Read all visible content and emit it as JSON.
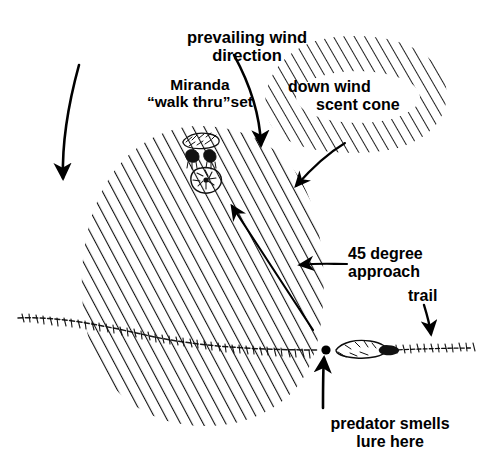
{
  "diagram": {
    "background_color": "#ffffff",
    "ink_color": "#000000",
    "labels": {
      "prevailing_wind_line1": "prevailing wind",
      "prevailing_wind_line2": "direction",
      "miranda_line1": "Miranda",
      "miranda_line2": "“walk thru”set",
      "down_wind_line1": "down wind",
      "down_wind_line2": "scent cone",
      "approach_line1": "45 degree",
      "approach_line2": "approach",
      "trail": "trail",
      "predator_line1": "predator smells",
      "predator_line2": "lure here"
    },
    "elements": {
      "scent_cone_region": "down-wind-scent-cone-ellipse",
      "main_cone_region": "main-scent-cone-ellipse",
      "trap_set_marker": "miranda-walk-thru-set-marker",
      "lure_point": "predator-smells-lure-point",
      "trail_path": "animal-trail-line",
      "approach_line": "45-degree-approach-line",
      "wind_arrow_left": "prevailing-wind-arrow-left",
      "wind_arrow_right": "prevailing-wind-arrow-right",
      "cone_link_arrow": "scent-cone-to-main-cone-arrow"
    }
  }
}
